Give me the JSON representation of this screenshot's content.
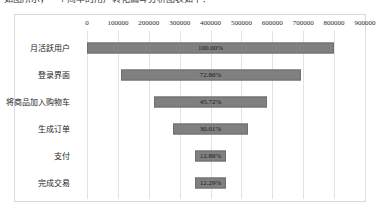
{
  "caption": "如图所示，一个简单的用户转化漏斗分析图表如下：",
  "chart_data": {
    "type": "bar",
    "subtype": "funnel",
    "title": "",
    "xlabel": "",
    "ylabel": "",
    "categories": [
      "月活跃用户",
      "登录界面",
      "将商品加入购物车",
      "生成订单",
      "支付",
      "完成交易"
    ],
    "values": [
      800000,
      582880,
      365760,
      240080,
      102880,
      98320
    ],
    "percent_labels": [
      "100.00%",
      "72.86%",
      "45.72%",
      "30.01%",
      "12.86%",
      "12.29%"
    ],
    "percents": [
      100.0,
      72.86,
      45.72,
      30.01,
      12.86,
      12.29
    ],
    "xticks": [
      0,
      100000,
      200000,
      300000,
      400000,
      500000,
      600000,
      700000,
      800000,
      900000
    ],
    "xtick_labels": [
      "0",
      "100000",
      "200000",
      "300000",
      "400000",
      "500000",
      "600000",
      "700000",
      "800000",
      "900000"
    ],
    "xlim": [
      0,
      900000
    ],
    "grid": true,
    "legend": false,
    "bar_color": "#808080",
    "bar_border_color": "#6f6f6f",
    "grid_color": "#e3e3e3",
    "frame_color": "#d9d9d9",
    "label_color": "#1a1a1a"
  }
}
